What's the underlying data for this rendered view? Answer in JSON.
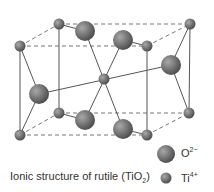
{
  "caption": {
    "text": "Ionic structure of rutile (TiO",
    "sub": "2",
    "close": ")"
  },
  "legend": {
    "oxygen": {
      "symbol": "O",
      "charge": "2−"
    },
    "titanium": {
      "symbol": "Ti",
      "charge": "4+"
    }
  },
  "colors": {
    "atom": "#6f6f6f",
    "line": "#555555",
    "dash": "#777777"
  }
}
